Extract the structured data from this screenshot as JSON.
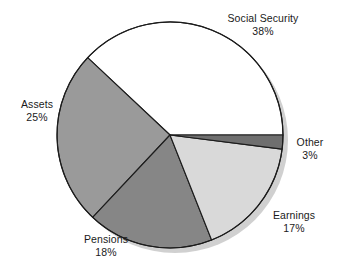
{
  "chart_data": {
    "type": "pie",
    "title": "",
    "categories": [
      "Social Security",
      "Assets",
      "Pensions",
      "Earnings",
      "Other"
    ],
    "values": [
      38,
      25,
      18,
      17,
      3
    ],
    "unit": "%",
    "legend": "none",
    "labels_position": "outside",
    "slices": [
      {
        "name": "Social Security",
        "value": 38,
        "value_label": "38%",
        "color": "#ffffff",
        "start_deg": 0,
        "end_deg": 136.8
      },
      {
        "name": "Assets",
        "value": 25,
        "value_label": "25%",
        "color": "#9a9a9a",
        "start_deg": 136.8,
        "end_deg": 226.8
      },
      {
        "name": "Pensions",
        "value": 18,
        "value_label": "18%",
        "color": "#868686",
        "start_deg": 226.8,
        "end_deg": 291.6
      },
      {
        "name": "Earnings",
        "value": 17,
        "value_label": "17%",
        "color": "#d9d9d9",
        "start_deg": 291.6,
        "end_deg": 352.8
      },
      {
        "name": "Other",
        "value": 3,
        "value_label": "3%",
        "color": "#6f6f6f",
        "start_deg": 352.8,
        "end_deg": 360
      }
    ],
    "geometry": {
      "center_x": 170,
      "center_y": 135,
      "radius": 113,
      "direction": "counterclockwise",
      "start_angle_deg": 0
    },
    "style": {
      "outline_color": "#1c1c1c",
      "shadow_color": "#c8c8c8",
      "background": "#ffffff"
    }
  }
}
